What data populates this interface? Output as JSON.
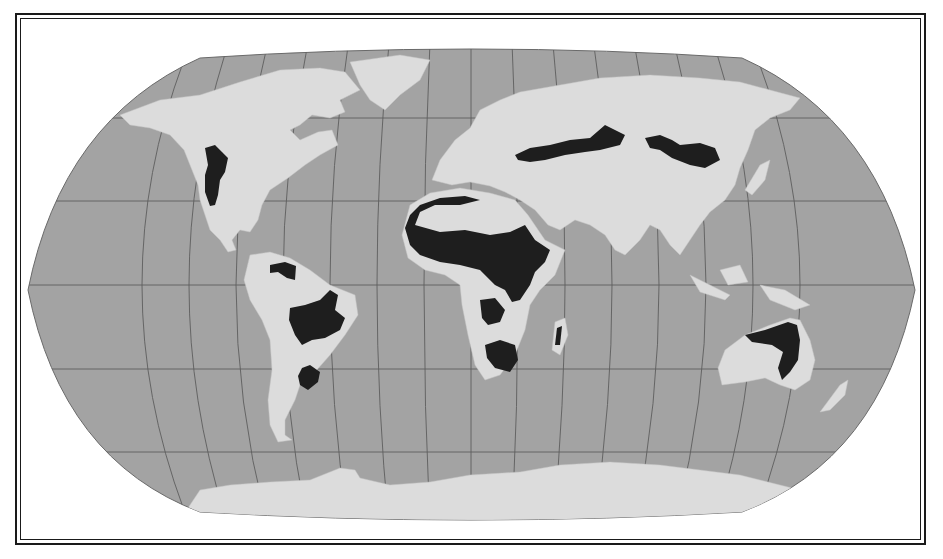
{
  "map": {
    "projection": "Robinson",
    "colors": {
      "ocean": "#a3a3a3",
      "land": "#dcdcdc",
      "highlight_region": "#1e1e1e",
      "graticule": "#5e5e5e",
      "border": "#1a1a1a",
      "background": "#ffffff"
    },
    "highlighted_regions": [
      "North American Great Plains",
      "Northern South America (Llanos)",
      "Brazilian Cerrado",
      "Pampas",
      "Sahel and Sudan savanna",
      "East African savanna",
      "Southern African savanna",
      "Madagascar west",
      "Eurasian Steppe",
      "Mongolian Steppe",
      "Northern and Eastern Australia"
    ]
  }
}
